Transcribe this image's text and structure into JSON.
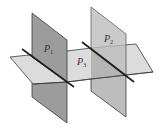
{
  "diagram": {
    "planes": [
      {
        "id": "P1",
        "label": "P",
        "subscript": "1",
        "orientation": "vertical",
        "fill": "#9c9c9c"
      },
      {
        "id": "P2",
        "label": "P",
        "subscript": "2",
        "orientation": "vertical",
        "fill": "#bdbdbd"
      },
      {
        "id": "P3",
        "label": "P",
        "subscript": "3",
        "orientation": "horizontal",
        "fill": "#dcdcdc"
      }
    ],
    "intersection_lines": [
      {
        "id": "L1",
        "between": [
          "P1",
          "P3"
        ]
      },
      {
        "id": "L2",
        "between": [
          "P2",
          "P3"
        ]
      }
    ],
    "colors": {
      "edge": "#3a3a3a",
      "line": "#1e1e1e",
      "overlap_shade": "#a8a8a8"
    }
  }
}
